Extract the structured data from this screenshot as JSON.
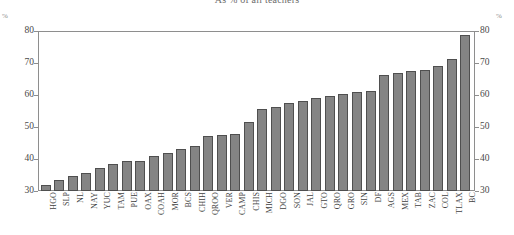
{
  "chart_data": {
    "type": "bar",
    "title": "As % of all teachers",
    "xlabel": "",
    "ylabel": "%",
    "ylim": [
      30,
      80
    ],
    "yticks": [
      30,
      40,
      50,
      60,
      70,
      80
    ],
    "grid": false,
    "legend": "none",
    "axis_unit_left": "%",
    "axis_unit_right": "%",
    "categories": [
      "HGO",
      "SLP",
      "NL",
      "NAY",
      "YUC",
      "TAM",
      "PUE",
      "OAX",
      "COAH",
      "MOR",
      "BCS",
      "CHIH",
      "QROO",
      "VER",
      "CAMP",
      "CHIS",
      "MICH",
      "DGO",
      "SON",
      "JAL",
      "GTO",
      "QRO",
      "GRO",
      "SIN",
      "DF",
      "AGS",
      "MEX",
      "TAB",
      "ZAC",
      "COL",
      "TLAX",
      "BC"
    ],
    "values": [
      32.0,
      33.6,
      34.8,
      35.6,
      37.2,
      38.4,
      39.4,
      39.6,
      41.1,
      42.0,
      43.2,
      44.3,
      47.4,
      47.6,
      48.0,
      51.8,
      56.0,
      56.6,
      57.8,
      58.4,
      59.3,
      60.0,
      60.6,
      61.4,
      61.6,
      66.8,
      67.4,
      68.1,
      68.2,
      69.7,
      71.8,
      79.5
    ]
  },
  "chart_meta": {
    "tick_labels_left": [
      "80",
      "70",
      "60",
      "50",
      "40",
      "30"
    ],
    "tick_labels_right": [
      "80",
      "70",
      "60",
      "50",
      "40",
      "30"
    ],
    "percent_symbol": "%"
  }
}
